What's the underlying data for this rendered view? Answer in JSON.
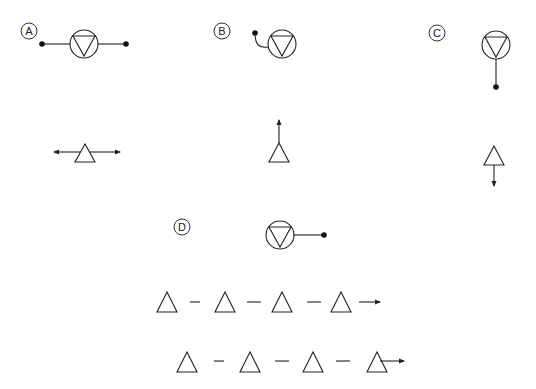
{
  "colors": {
    "line": "#222222",
    "dot": "#111111",
    "background": "#ffffff"
  },
  "labels": {
    "a": "A",
    "b": "B",
    "c": "C",
    "d": "D"
  },
  "panels": [
    {
      "id": "A",
      "symbol": "circle-inverted-triangle",
      "connector": "horizontal line with dots on both sides"
    },
    {
      "id": "B",
      "symbol": "circle-inverted-triangle",
      "connector": "curved lead to dot at upper left"
    },
    {
      "id": "C",
      "symbol": "circle-inverted-triangle",
      "connector": "vertical line down to dot"
    },
    {
      "id": "D",
      "symbol": "circle-inverted-triangle",
      "connector": "horizontal line to dot at right"
    }
  ],
  "arrow_triangles": [
    {
      "position": "left",
      "arrow": "double horizontal"
    },
    {
      "position": "center",
      "arrow": "up"
    },
    {
      "position": "right",
      "arrow": "down"
    }
  ],
  "sequences": [
    {
      "row": 1,
      "count": 4,
      "end": "arrow after last triangle"
    },
    {
      "row": 2,
      "count": 4,
      "end": "arrow from inside last triangle"
    }
  ]
}
